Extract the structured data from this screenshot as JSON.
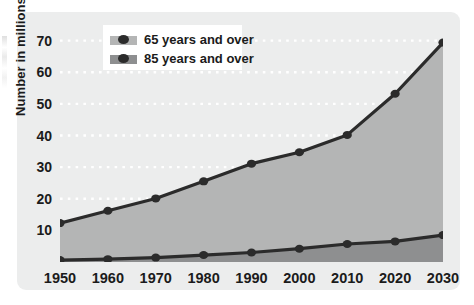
{
  "chart_data": {
    "type": "area",
    "title": "",
    "subtitle": "",
    "xlabel": "",
    "ylabel": "Number in millions",
    "categories": [
      1950,
      1960,
      1970,
      1980,
      1990,
      2000,
      2010,
      2020,
      2030
    ],
    "x_tick_labels": [
      "1950",
      "1960",
      "1970",
      "1980",
      "1990",
      "2000",
      "2010",
      "2020",
      "2030"
    ],
    "y_tick_labels": [
      "10",
      "20",
      "30",
      "40",
      "50",
      "60",
      "70"
    ],
    "y_ticks": [
      10,
      20,
      30,
      40,
      50,
      60,
      70
    ],
    "xlim": [
      1950,
      2030
    ],
    "ylim": [
      0,
      74
    ],
    "grid": "horizontal-dotted-white",
    "legend_position": "top-left-inside",
    "stacked": false,
    "series": [
      {
        "name": "65 years and over",
        "values": [
          12.3,
          16.2,
          20.1,
          25.5,
          31.1,
          34.7,
          40.2,
          53.2,
          69.4
        ],
        "fill_color": "#b4b5b5",
        "line_color": "#2b2b2b",
        "marker": "circle"
      },
      {
        "name": "85 years and over",
        "values": [
          0.6,
          0.9,
          1.4,
          2.2,
          3.0,
          4.2,
          5.7,
          6.5,
          8.5
        ],
        "fill_color": "#8e8f90",
        "line_color": "#2b2b2b",
        "marker": "circle"
      }
    ]
  },
  "legend": {
    "items": [
      {
        "label": "65 years and over",
        "swatch_color": "#b4b5b5"
      },
      {
        "label": "85 years and over",
        "swatch_color": "#8e8f90"
      }
    ]
  },
  "axes": {
    "y_title": "Number in millions"
  },
  "colors": {
    "panel_background": "#eceded",
    "plot_background": "#eceded",
    "gridline": "#ffffff",
    "series_65_fill": "#b4b5b5",
    "series_85_fill": "#8e8f90",
    "line": "#2b2b2b",
    "text": "#1b1b1b",
    "legend_background": "#ffffff"
  }
}
